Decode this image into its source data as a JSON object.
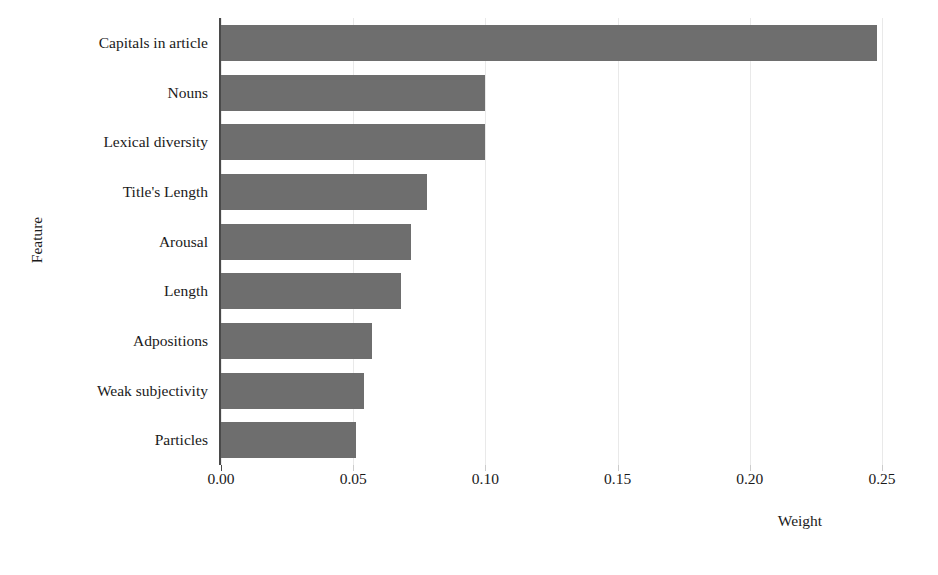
{
  "chart_data": {
    "type": "bar",
    "orientation": "horizontal",
    "title": "",
    "xlabel": "Weight",
    "ylabel": "Feature",
    "categories": [
      "Capitals in article",
      "Nouns",
      "Lexical diversity",
      "Title's Length",
      "Arousal",
      "Length",
      "Adpositions",
      "Weak subjectivity",
      "Particles"
    ],
    "values": [
      0.248,
      0.1,
      0.1,
      0.078,
      0.072,
      0.068,
      0.057,
      0.054,
      0.051
    ],
    "xlim": [
      0.0,
      0.2595
    ],
    "xticks": [
      0.0,
      0.05,
      0.1,
      0.15,
      0.2,
      0.25
    ],
    "xtick_labels": [
      "0.00",
      "0.05",
      "0.10",
      "0.15",
      "0.20",
      "0.25"
    ],
    "grid": "vertical-only",
    "legend": "none",
    "bar_color": "#6e6e6e",
    "grid_color": "#e9e9e9",
    "axis_color": "#4a4a4a",
    "background": "#ffffff"
  }
}
